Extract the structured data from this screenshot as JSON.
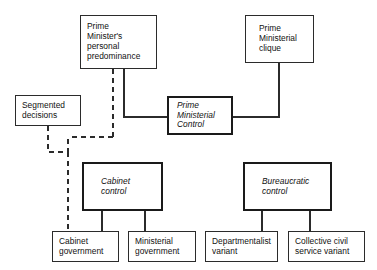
{
  "diagram": {
    "type": "flow-diagram",
    "background_color": "#ffffff",
    "line_color": "#2b2b2b",
    "nodes": [
      {
        "id": "pm-predominance",
        "lines": [
          "Prime",
          "Minister's",
          "personal",
          "predominance"
        ],
        "style": "plain"
      },
      {
        "id": "pm-clique",
        "lines": [
          "Prime",
          "Ministerial",
          "clique"
        ],
        "style": "plain"
      },
      {
        "id": "segmented-decisions",
        "lines": [
          "Segmented",
          "decisions"
        ],
        "style": "plain"
      },
      {
        "id": "pm-control",
        "lines": [
          "Prime",
          "Ministerial",
          "Control"
        ],
        "style": "emphasis-italic-bold-border"
      },
      {
        "id": "cabinet-control",
        "lines": [
          "Cabinet",
          "control"
        ],
        "style": "emphasis-italic-bold-border"
      },
      {
        "id": "bureaucratic-control",
        "lines": [
          "Bureaucratic",
          "control"
        ],
        "style": "emphasis-italic-bold-border"
      },
      {
        "id": "cabinet-government",
        "lines": [
          "Cabinet",
          "government"
        ],
        "style": "plain"
      },
      {
        "id": "ministerial-government",
        "lines": [
          "Ministerial",
          "government"
        ],
        "style": "plain"
      },
      {
        "id": "departmentalist-variant",
        "lines": [
          "Departmentalist",
          "variant"
        ],
        "style": "plain"
      },
      {
        "id": "collective-civil-service-variant",
        "lines": [
          "Collective civil",
          "service variant"
        ],
        "style": "plain"
      }
    ],
    "edges": [
      {
        "from": "pm-predominance",
        "to": "pm-control",
        "line": "solid"
      },
      {
        "from": "pm-clique",
        "to": "pm-control",
        "line": "solid"
      },
      {
        "from": "pm-predominance",
        "to": "segmented-path",
        "line": "dashed"
      },
      {
        "from": "segmented-decisions",
        "to": "cabinet-government",
        "line": "dashed"
      },
      {
        "from": "cabinet-control",
        "to": "cabinet-government",
        "line": "solid"
      },
      {
        "from": "cabinet-control",
        "to": "ministerial-government",
        "line": "solid"
      },
      {
        "from": "bureaucratic-control",
        "to": "departmentalist-variant",
        "line": "solid"
      },
      {
        "from": "bureaucratic-control",
        "to": "collective-civil-service-variant",
        "line": "solid"
      }
    ]
  }
}
